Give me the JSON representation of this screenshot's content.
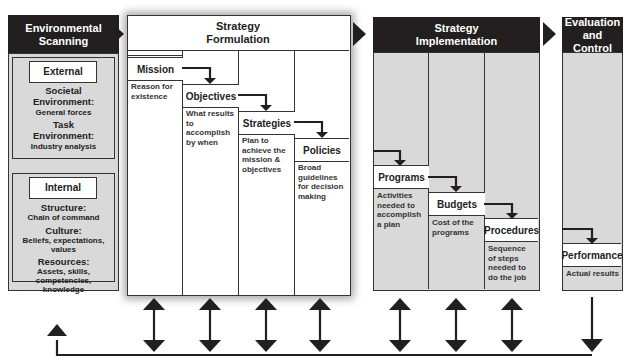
{
  "diagram": {
    "stages": [
      {
        "id": "environmental-scanning",
        "title": "Environmental Scanning"
      },
      {
        "id": "strategy-formulation",
        "title": "Strategy Formulation"
      },
      {
        "id": "strategy-implementation",
        "title": "Strategy Implementation"
      },
      {
        "id": "evaluation-control",
        "title": "Evaluation and Control"
      }
    ],
    "scanning": {
      "external": {
        "label": "External",
        "items": [
          {
            "heading": "Societal Environment:",
            "detail": "General forces"
          },
          {
            "heading": "Task Environment:",
            "detail": "Industry analysis"
          }
        ]
      },
      "internal": {
        "label": "Internal",
        "items": [
          {
            "heading": "Structure:",
            "detail": "Chain of command"
          },
          {
            "heading": "Culture:",
            "detail": "Beliefs, expectations, values"
          },
          {
            "heading": "Resources:",
            "detail": "Assets, skills, competencies, knowledge"
          }
        ]
      }
    },
    "formulation": [
      {
        "label": "Mission",
        "desc": "Reason for existence"
      },
      {
        "label": "Objectives",
        "desc": "What results to accomplish by when"
      },
      {
        "label": "Strategies",
        "desc": "Plan to achieve the mission & objectives"
      },
      {
        "label": "Policies",
        "desc": "Broad guidelines for decision making"
      }
    ],
    "implementation": [
      {
        "label": "Programs",
        "desc": "Activities needed to accomplish a plan"
      },
      {
        "label": "Budgets",
        "desc": "Cost of the programs"
      },
      {
        "label": "Procedures",
        "desc": "Sequence of steps needed to do the job"
      }
    ],
    "evaluation": [
      {
        "label": "Performance",
        "desc": "Actual results"
      }
    ],
    "colors": {
      "dark": "#231f20",
      "panel": "#d9d9d9",
      "line": "#333333"
    }
  }
}
